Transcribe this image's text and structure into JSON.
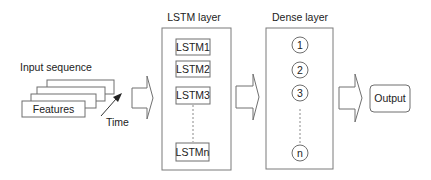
{
  "diagram": {
    "input": {
      "title": "Input sequence",
      "features_label": "Features",
      "time_label": "Time",
      "stack_count": 4
    },
    "lstm_layer": {
      "title": "LSTM layer",
      "units": [
        "LSTM1",
        "LSTM2",
        "LSTM3",
        "LSTMn"
      ]
    },
    "dense_layer": {
      "title": "Dense layer",
      "nodes": [
        "1",
        "2",
        "3",
        "n"
      ]
    },
    "output": {
      "label": "Output"
    },
    "flow": [
      "Input sequence",
      "LSTM layer",
      "Dense layer",
      "Output"
    ],
    "colors": {
      "stroke": "#707070",
      "text": "#222222",
      "background": "#ffffff"
    }
  }
}
